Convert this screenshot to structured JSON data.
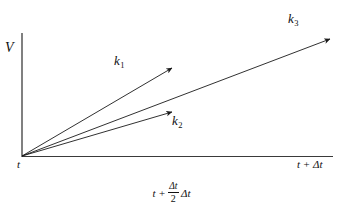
{
  "figure": {
    "type": "vector-diagram",
    "background_color": "#ffffff",
    "line_color": "#1a1a1a",
    "axes": {
      "vertical": {
        "label": "V",
        "x": 22,
        "y_top": 33,
        "y_bottom": 157
      },
      "horizontal": {
        "y": 156,
        "x_start": 22,
        "x_end": 333,
        "start_label": "t",
        "end_label": "t + Δt"
      }
    },
    "midpoint_label": {
      "prefix": "t +",
      "fraction_numerator": "Δt",
      "fraction_denominator": "2",
      "suffix": "Δt"
    },
    "vectors": [
      {
        "name": "k1",
        "label": "k",
        "subscript": "1",
        "x1": 22,
        "y1": 156,
        "x2": 172,
        "y2": 68
      },
      {
        "name": "k2",
        "label": "k",
        "subscript": "2",
        "x1": 22,
        "y1": 156,
        "x2": 172,
        "y2": 112
      },
      {
        "name": "k3",
        "label": "k",
        "subscript": "3",
        "x1": 22,
        "y1": 156,
        "x2": 330,
        "y2": 39
      }
    ]
  }
}
